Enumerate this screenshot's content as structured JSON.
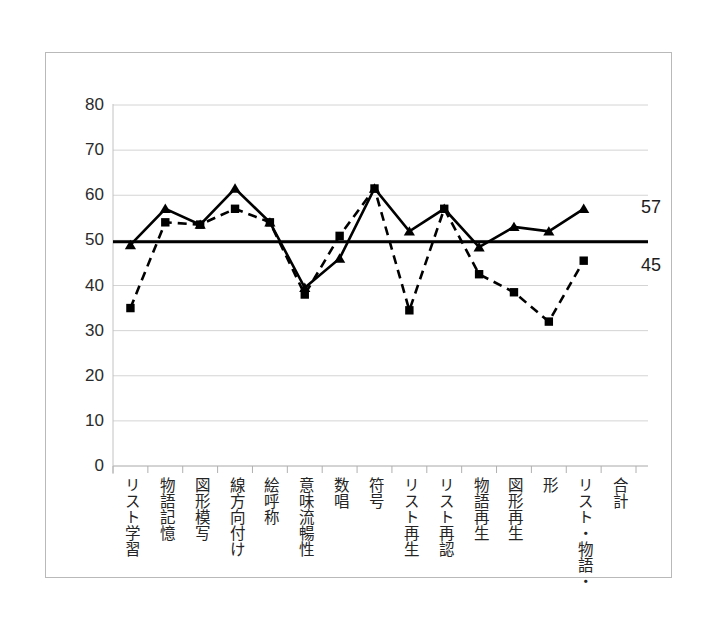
{
  "figure": {
    "background_color": "#ffffff",
    "frame_color": "#b9b9b9"
  },
  "chart_data": {
    "type": "line",
    "title": "",
    "subtitle": "",
    "xlabel": "",
    "ylabel": "",
    "ylim": [
      0,
      80
    ],
    "ytick_labels": [
      "0",
      "10",
      "20",
      "30",
      "40",
      "50",
      "60",
      "70",
      "80"
    ],
    "yticks": [
      0,
      10,
      20,
      30,
      40,
      50,
      60,
      70,
      80
    ],
    "grid": true,
    "grid_axis": "y",
    "legend": "none",
    "legend_position": "right-end-labels",
    "categories": [
      "リスト学習",
      "物語記憶",
      "図形模写",
      "線方向付け",
      "絵呼称",
      "意味流暢性",
      "数唱",
      "符号",
      "リスト再生",
      "リスト再認",
      "物語再生",
      "図形再生",
      "形",
      "リスト・物語・",
      "合計"
    ],
    "series": [
      {
        "name": "series-solid-triangle",
        "marker": "triangle",
        "line_style": "solid",
        "color": "#000000",
        "end_label": "57",
        "values": [
          49,
          57,
          53.5,
          61.5,
          54,
          39.5,
          46,
          61.5,
          52,
          57,
          48.5,
          53,
          52,
          57,
          null
        ]
      },
      {
        "name": "series-dashed-square",
        "marker": "square",
        "line_style": "dashed",
        "color": "#000000",
        "end_label": "45",
        "values": [
          35,
          54,
          53.5,
          57,
          54,
          38,
          51,
          61.5,
          34.5,
          57,
          42.5,
          38.5,
          32,
          45.5,
          null
        ]
      }
    ],
    "reference_line": {
      "name": "mean-reference-line",
      "value": 49.7,
      "color": "#000000",
      "width": 3
    }
  }
}
